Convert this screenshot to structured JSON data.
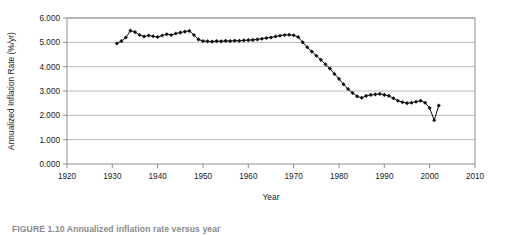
{
  "figure": {
    "caption": "FIGURE 1.10  Annualized inflation rate versus year"
  },
  "chart_data": {
    "type": "scatter",
    "title": "",
    "xlabel": "Year",
    "ylabel": "Annualized Inflation Rate (%/yr)",
    "xlim": [
      1920,
      2010
    ],
    "ylim": [
      0.0,
      6.0
    ],
    "xticks": [
      1920,
      1930,
      1940,
      1950,
      1960,
      1970,
      1980,
      1990,
      2000,
      2010
    ],
    "xtick_labels": [
      "1920",
      "1930",
      "1940",
      "1950",
      "1960",
      "1970",
      "1980",
      "1990",
      "2000",
      "2010"
    ],
    "yticks": [
      0.0,
      1.0,
      2.0,
      3.0,
      4.0,
      5.0,
      6.0
    ],
    "ytick_labels": [
      "0.000",
      "1.000",
      "2.000",
      "3.000",
      "4.000",
      "5.000",
      "6.000"
    ],
    "grid": "horizontal",
    "legend": "none",
    "marker": "filled-diamond",
    "marker_color": "#111111",
    "line_color": "#111111",
    "series": [
      {
        "name": "Annualized Inflation Rate",
        "x": [
          1931,
          1932,
          1933,
          1934,
          1935,
          1936,
          1937,
          1938,
          1939,
          1940,
          1941,
          1942,
          1943,
          1944,
          1945,
          1946,
          1947,
          1948,
          1949,
          1950,
          1951,
          1952,
          1953,
          1954,
          1955,
          1956,
          1957,
          1958,
          1959,
          1960,
          1961,
          1962,
          1963,
          1964,
          1965,
          1966,
          1967,
          1968,
          1969,
          1970,
          1971,
          1972,
          1973,
          1974,
          1975,
          1976,
          1977,
          1978,
          1979,
          1980,
          1981,
          1982,
          1983,
          1984,
          1985,
          1986,
          1987,
          1988,
          1989,
          1990,
          1991,
          1992,
          1993,
          1994,
          1995,
          1996,
          1997,
          1998,
          1999,
          2000,
          2001,
          2002
        ],
        "y": [
          4.95,
          5.05,
          5.2,
          5.48,
          5.42,
          5.3,
          5.24,
          5.28,
          5.25,
          5.22,
          5.28,
          5.33,
          5.3,
          5.36,
          5.4,
          5.44,
          5.47,
          5.3,
          5.12,
          5.05,
          5.04,
          5.03,
          5.05,
          5.04,
          5.06,
          5.05,
          5.07,
          5.06,
          5.08,
          5.09,
          5.1,
          5.12,
          5.15,
          5.18,
          5.2,
          5.24,
          5.27,
          5.3,
          5.31,
          5.29,
          5.22,
          5.0,
          4.8,
          4.62,
          4.45,
          4.28,
          4.1,
          3.92,
          3.7,
          3.5,
          3.28,
          3.08,
          2.92,
          2.78,
          2.72,
          2.8,
          2.84,
          2.86,
          2.88,
          2.84,
          2.8,
          2.7,
          2.6,
          2.54,
          2.5,
          2.52,
          2.56,
          2.6,
          2.52,
          2.3,
          1.8,
          2.4
        ]
      }
    ]
  }
}
